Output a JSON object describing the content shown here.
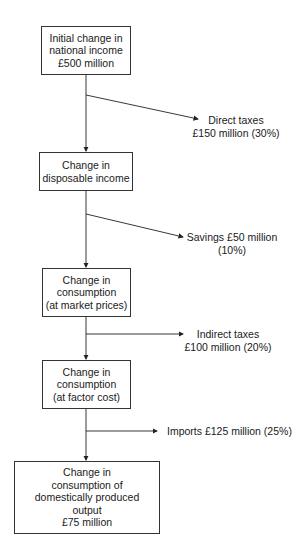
{
  "diagram": {
    "type": "flowchart",
    "boxes": [
      {
        "id": "initial",
        "lines": [
          "Initial change in",
          "national income",
          "£500 million"
        ]
      },
      {
        "id": "disposable",
        "lines": [
          "Change in",
          "disposable income"
        ]
      },
      {
        "id": "market",
        "lines": [
          "Change in",
          "consumption",
          "(at market prices)"
        ]
      },
      {
        "id": "factor",
        "lines": [
          "Change in",
          "consumption",
          "(at factor cost)"
        ]
      },
      {
        "id": "domestic",
        "lines": [
          "Change in",
          "consumption of",
          "domestically produced",
          "output",
          "£75 million"
        ]
      }
    ],
    "leakages": [
      {
        "id": "direct-taxes",
        "lines": [
          "Direct taxes",
          "£150 million (30%)"
        ]
      },
      {
        "id": "savings",
        "lines": [
          "Savings £50 million",
          "(10%)"
        ]
      },
      {
        "id": "indirect-taxes",
        "lines": [
          "Indirect taxes",
          "£100 million (20%)"
        ]
      },
      {
        "id": "imports",
        "lines": [
          "Imports £125 million (25%)"
        ]
      }
    ],
    "colors": {
      "line": "#222222",
      "box_border": "#333333",
      "text": "#1a1a1a",
      "background": "#ffffff"
    }
  }
}
